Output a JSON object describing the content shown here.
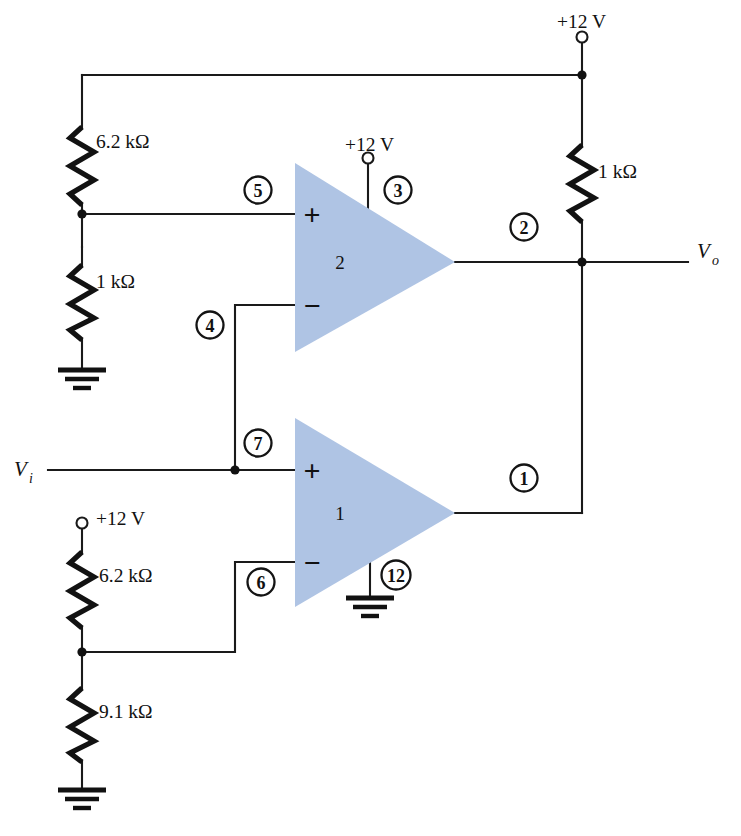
{
  "diagram": {
    "accent_fill": "#afc4e4",
    "line_color": "#1a1a1a"
  },
  "supplies": {
    "top_right": "+12 V",
    "amp2_pin3": "+12 V",
    "bottom_left": "+12 V"
  },
  "resistors": {
    "r_top_left": "6.2 kΩ",
    "r_mid_left": "1 kΩ",
    "r_right": "1 kΩ",
    "r_bottom_upper": "6.2 kΩ",
    "r_bottom_lower": "9.1 kΩ"
  },
  "signals": {
    "input_label": "V",
    "input_sub": "i",
    "output_label": "V",
    "output_sub": "o"
  },
  "amplifiers": [
    {
      "id": "amp2",
      "label": "2",
      "plus": "+",
      "minus": "−"
    },
    {
      "id": "amp1",
      "label": "1",
      "plus": "+",
      "minus": "−"
    }
  ],
  "pins": [
    {
      "num": "5",
      "cx": 258,
      "cy": 190
    },
    {
      "num": "3",
      "cx": 398,
      "cy": 190
    },
    {
      "num": "2",
      "cx": 524,
      "cy": 227
    },
    {
      "num": "4",
      "cx": 210,
      "cy": 325
    },
    {
      "num": "7",
      "cx": 258,
      "cy": 443
    },
    {
      "num": "1",
      "cx": 524,
      "cy": 478
    },
    {
      "num": "6",
      "cx": 261,
      "cy": 582
    },
    {
      "num": "12",
      "cx": 396,
      "cy": 575
    }
  ]
}
